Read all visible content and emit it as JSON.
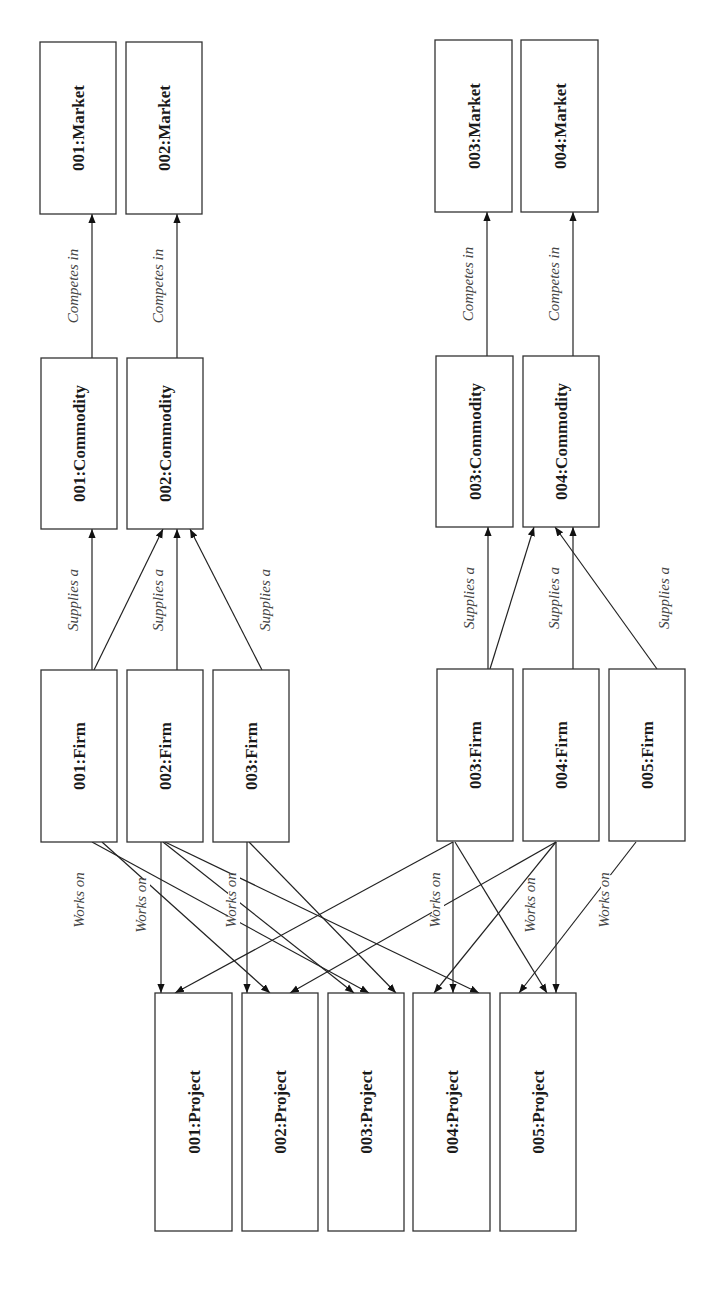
{
  "nodes": {
    "markets": [
      {
        "id": "m1",
        "label": "001:Market",
        "x": 40,
        "y": 42,
        "w": 76,
        "h": 172
      },
      {
        "id": "m2",
        "label": "002:Market",
        "x": 126,
        "y": 42,
        "w": 76,
        "h": 172
      },
      {
        "id": "m3",
        "label": "003:Market",
        "x": 435,
        "y": 40,
        "w": 77,
        "h": 172
      },
      {
        "id": "m4",
        "label": "004:Market",
        "x": 521,
        "y": 40,
        "w": 77,
        "h": 172
      }
    ],
    "commodities": [
      {
        "id": "c1",
        "label": "001:Commodity",
        "x": 41,
        "y": 358,
        "w": 76,
        "h": 171
      },
      {
        "id": "c2",
        "label": "002:Commodity",
        "x": 127,
        "y": 358,
        "w": 76,
        "h": 171
      },
      {
        "id": "c3",
        "label": "003:Commodity",
        "x": 436,
        "y": 356,
        "w": 77,
        "h": 171
      },
      {
        "id": "c4",
        "label": "004:Commodity",
        "x": 523,
        "y": 356,
        "w": 76,
        "h": 171
      }
    ],
    "firms": [
      {
        "id": "f1",
        "label": "001:Firm",
        "x": 41,
        "y": 670,
        "w": 76,
        "h": 172
      },
      {
        "id": "f2",
        "label": "002:Firm",
        "x": 127,
        "y": 670,
        "w": 76,
        "h": 172
      },
      {
        "id": "f3",
        "label": "003:Firm",
        "x": 213,
        "y": 670,
        "w": 76,
        "h": 172
      },
      {
        "id": "f4",
        "label": "003:Firm",
        "x": 437,
        "y": 669,
        "w": 76,
        "h": 172
      },
      {
        "id": "f5",
        "label": "004:Firm",
        "x": 523,
        "y": 669,
        "w": 76,
        "h": 172
      },
      {
        "id": "f6",
        "label": "005:Firm",
        "x": 609,
        "y": 669,
        "w": 76,
        "h": 172
      }
    ],
    "projects": [
      {
        "id": "p1",
        "label": "001:Project",
        "x": 155,
        "y": 993,
        "w": 77,
        "h": 238
      },
      {
        "id": "p2",
        "label": "002:Project",
        "x": 242,
        "y": 993,
        "w": 76,
        "h": 238
      },
      {
        "id": "p3",
        "label": "003:Project",
        "x": 328,
        "y": 993,
        "w": 76,
        "h": 238
      },
      {
        "id": "p4",
        "label": "004:Project",
        "x": 413,
        "y": 993,
        "w": 77,
        "h": 238
      },
      {
        "id": "p5",
        "label": "005:Project",
        "x": 500,
        "y": 993,
        "w": 76,
        "h": 238
      }
    ]
  },
  "edge_labels": {
    "competes_in": "Competes in",
    "supplies_a": "Supplies a",
    "works_on": "Works on"
  },
  "edges": {
    "competes_in": [
      {
        "x1": 92,
        "y1": 358,
        "x2": 92,
        "y2": 214
      },
      {
        "x1": 177,
        "y1": 358,
        "x2": 177,
        "y2": 214
      },
      {
        "x1": 487,
        "y1": 356,
        "x2": 487,
        "y2": 212
      },
      {
        "x1": 573,
        "y1": 356,
        "x2": 573,
        "y2": 212
      }
    ],
    "supplies_a": [
      {
        "x1": 92,
        "y1": 670,
        "x2": 92,
        "y2": 529
      },
      {
        "x1": 94,
        "y1": 670,
        "x2": 163,
        "y2": 529
      },
      {
        "x1": 177,
        "y1": 670,
        "x2": 177,
        "y2": 529
      },
      {
        "x1": 262,
        "y1": 670,
        "x2": 190,
        "y2": 529
      },
      {
        "x1": 488,
        "y1": 669,
        "x2": 488,
        "y2": 527
      },
      {
        "x1": 490,
        "y1": 669,
        "x2": 534,
        "y2": 527
      },
      {
        "x1": 573,
        "y1": 669,
        "x2": 573,
        "y2": 527
      },
      {
        "x1": 657,
        "y1": 669,
        "x2": 555,
        "y2": 527
      }
    ],
    "works_on": [
      {
        "x1": 92,
        "y1": 842,
        "x2": 369,
        "y2": 993
      },
      {
        "x1": 102,
        "y1": 842,
        "x2": 270,
        "y2": 993
      },
      {
        "x1": 161,
        "y1": 842,
        "x2": 161,
        "y2": 993
      },
      {
        "x1": 163,
        "y1": 842,
        "x2": 354,
        "y2": 993
      },
      {
        "x1": 165,
        "y1": 842,
        "x2": 479,
        "y2": 993
      },
      {
        "x1": 247,
        "y1": 842,
        "x2": 247,
        "y2": 993
      },
      {
        "x1": 249,
        "y1": 842,
        "x2": 396,
        "y2": 993
      },
      {
        "x1": 453,
        "y1": 842,
        "x2": 175,
        "y2": 993
      },
      {
        "x1": 453,
        "y1": 842,
        "x2": 453,
        "y2": 993
      },
      {
        "x1": 455,
        "y1": 842,
        "x2": 547,
        "y2": 993
      },
      {
        "x1": 556,
        "y1": 842,
        "x2": 290,
        "y2": 993
      },
      {
        "x1": 556,
        "y1": 842,
        "x2": 434,
        "y2": 993
      },
      {
        "x1": 556,
        "y1": 842,
        "x2": 556,
        "y2": 993
      },
      {
        "x1": 636,
        "y1": 842,
        "x2": 519,
        "y2": 993
      }
    ]
  },
  "label_positions": {
    "competes_in": [
      {
        "x": 78,
        "y": 286
      },
      {
        "x": 163,
        "y": 286
      },
      {
        "x": 473,
        "y": 284
      },
      {
        "x": 559,
        "y": 284
      }
    ],
    "supplies_a": [
      {
        "x": 78,
        "y": 600
      },
      {
        "x": 163,
        "y": 600
      },
      {
        "x": 270,
        "y": 600
      },
      {
        "x": 474,
        "y": 598
      },
      {
        "x": 559,
        "y": 598
      },
      {
        "x": 669,
        "y": 598
      }
    ],
    "works_on": [
      {
        "x": 84,
        "y": 900
      },
      {
        "x": 146,
        "y": 905
      },
      {
        "x": 236,
        "y": 900
      },
      {
        "x": 440,
        "y": 900
      },
      {
        "x": 535,
        "y": 905
      },
      {
        "x": 609,
        "y": 900
      }
    ]
  }
}
